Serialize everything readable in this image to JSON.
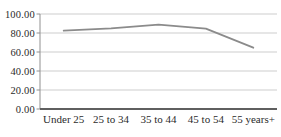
{
  "chart_data": {
    "type": "line",
    "title": "",
    "xlabel": "",
    "ylabel": "",
    "categories": [
      "Under 25",
      "25 to 34",
      "35 to 44",
      "45 to 54",
      "55 years+"
    ],
    "values": [
      82.5,
      85.0,
      88.7,
      84.5,
      64.5
    ],
    "ylim": [
      0,
      100
    ],
    "ytick_values": [
      100,
      80,
      60,
      40,
      20,
      0
    ],
    "ytick_labels": [
      "100.00",
      "80.00",
      "60.00",
      "40.00",
      "20.00",
      "0.00"
    ],
    "grid": true,
    "legend": "none",
    "markers": false,
    "colors": {
      "line": "#8b8b8b",
      "grid": "#cdcdcd",
      "y_axis": "#909090",
      "x_axis": "#5f5f5f",
      "text": "#2b2b2b",
      "background": "#ffffff"
    }
  }
}
